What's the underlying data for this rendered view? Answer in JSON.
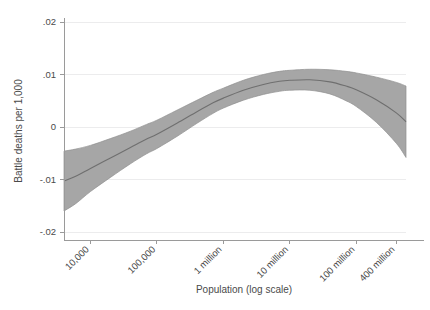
{
  "chart_data": {
    "type": "line",
    "title": "",
    "xlabel": "Population (log scale)",
    "ylabel": "Battle deaths per 1,000",
    "xscale": "log",
    "grid": true,
    "legend": null,
    "xlim": [
      4000,
      560000000
    ],
    "ylim": [
      -0.02,
      0.02
    ],
    "ytick_labels": [
      ".02",
      ".01",
      "0",
      "-.01",
      "-.02"
    ],
    "ytick_values": [
      0.02,
      0.01,
      0,
      -0.01,
      -0.02
    ],
    "xtick_labels": [
      "10,000",
      "100,000",
      "1 million",
      "10 million",
      "100 million",
      "400 million"
    ],
    "xtick_values": [
      10000,
      100000,
      1000000,
      10000000,
      100000000,
      400000000
    ],
    "series": [
      {
        "name": "Fitted value",
        "x": [
          4000,
          6000,
          10000,
          20000,
          40000,
          70000,
          100000,
          200000,
          400000,
          700000,
          1000000,
          2000000,
          4000000,
          7000000,
          10000000,
          20000000,
          40000000,
          70000000,
          100000000,
          200000000,
          400000000,
          560000000
        ],
        "values": [
          -0.0103,
          -0.0094,
          -0.0079,
          -0.0059,
          -0.0039,
          -0.0023,
          -0.0014,
          0.0007,
          0.0029,
          0.0046,
          0.0055,
          0.007,
          0.0081,
          0.0087,
          0.0089,
          0.009,
          0.0086,
          0.0078,
          0.0071,
          0.0052,
          0.0027,
          0.001
        ]
      }
    ],
    "confidence_band": {
      "name": "95% confidence interval",
      "x": [
        4000,
        6000,
        10000,
        20000,
        40000,
        70000,
        100000,
        200000,
        400000,
        700000,
        1000000,
        2000000,
        4000000,
        7000000,
        10000000,
        20000000,
        40000000,
        70000000,
        100000000,
        200000000,
        400000000,
        560000000
      ],
      "upper": [
        -0.0046,
        -0.0042,
        -0.0035,
        -0.0022,
        -0.0008,
        0.0005,
        0.0013,
        0.0032,
        0.0051,
        0.0066,
        0.0074,
        0.0089,
        0.01,
        0.0106,
        0.0108,
        0.011,
        0.0109,
        0.0106,
        0.0103,
        0.0095,
        0.0085,
        0.0078
      ],
      "lower": [
        -0.016,
        -0.0146,
        -0.0123,
        -0.0096,
        -0.007,
        -0.0051,
        -0.0041,
        -0.0018,
        0.0007,
        0.0026,
        0.0036,
        0.0051,
        0.0062,
        0.0068,
        0.007,
        0.007,
        0.0063,
        0.005,
        0.0039,
        0.0009,
        -0.0031,
        -0.0058
      ]
    },
    "colors": {
      "band_fill": "#a6a6a6",
      "band_edge": "#8f8f8f",
      "fit_line": "#6f6f6f",
      "gridline": "#ececed",
      "axis": "#9a9a9a",
      "text": "#4a4a4a",
      "background": "#ffffff"
    }
  }
}
